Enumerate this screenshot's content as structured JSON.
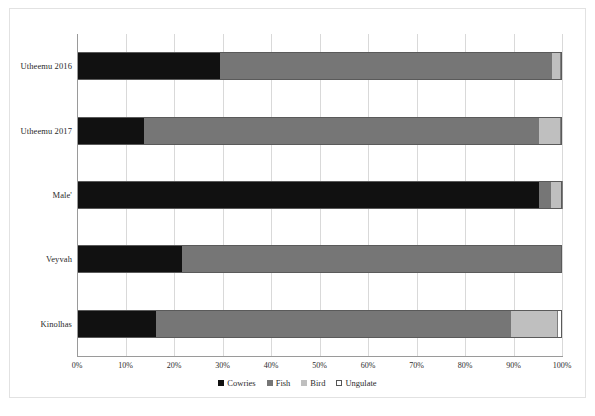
{
  "chart_data": {
    "type": "bar",
    "orientation": "horizontal",
    "stacked": true,
    "stack_mode": "percent",
    "title": "",
    "subtitle": "",
    "xlabel": "",
    "ylabel": "",
    "xlim": [
      0,
      100
    ],
    "grid": true,
    "legend_position": "bottom",
    "categories": [
      "Utheemu 2016",
      "Utheemu 2017",
      "Male'",
      "Veyvah",
      "Kinolhas"
    ],
    "xticks": [
      "0%",
      "10%",
      "20%",
      "30%",
      "40%",
      "50%",
      "60%",
      "70%",
      "80%",
      "90%",
      "100%"
    ],
    "xtick_values": [
      0,
      10,
      20,
      30,
      40,
      50,
      60,
      70,
      80,
      90,
      100
    ],
    "series": [
      {
        "name": "Cowries",
        "color": "#111111",
        "values": [
          29.5,
          13.8,
          95.3,
          21.6,
          16.3
        ]
      },
      {
        "name": "Fish",
        "color": "#767676",
        "values": [
          68.5,
          81.5,
          2.5,
          78.4,
          73.2
        ]
      },
      {
        "name": "Bird",
        "color": "#bfbfbf",
        "values": [
          1.5,
          4.2,
          1.9,
          0.0,
          9.5
        ]
      },
      {
        "name": "Ungulate",
        "color": "#ffffff",
        "values": [
          0.5,
          0.5,
          0.3,
          0.0,
          1.0
        ]
      }
    ],
    "legend": [
      "Cowries",
      "Fish",
      "Bird",
      "Ungulate"
    ]
  },
  "axis": {
    "ticks": [
      {
        "label": "0%",
        "value": 0
      },
      {
        "label": "10%",
        "value": 10
      },
      {
        "label": "20%",
        "value": 20
      },
      {
        "label": "30%",
        "value": 30
      },
      {
        "label": "40%",
        "value": 40
      },
      {
        "label": "50%",
        "value": 50
      },
      {
        "label": "60%",
        "value": 60
      },
      {
        "label": "70%",
        "value": 70
      },
      {
        "label": "80%",
        "value": 80
      },
      {
        "label": "90%",
        "value": 90
      },
      {
        "label": "100%",
        "value": 100
      }
    ]
  },
  "colors": {
    "cowries": "#111111",
    "fish": "#767676",
    "bird": "#bfbfbf",
    "ungulate": "#ffffff",
    "grid": "#d9d9d9",
    "axis": "#9a9a9a",
    "frame": "#e2e2e2",
    "text": "#2b2b2b"
  }
}
